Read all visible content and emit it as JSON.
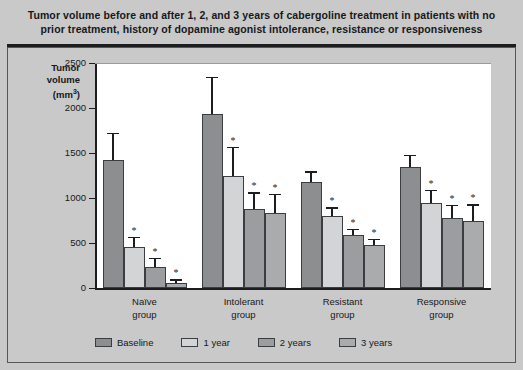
{
  "figure": {
    "title": "Tumor volume before and after 1, 2, and 3 years of cabergoline treatment in patients with no prior treatment, history of dopamine agonist intolerance, resistance or responsiveness",
    "axis_title_line1": "Tumor",
    "axis_title_line2": "volume",
    "axis_title_unit": "(mm",
    "axis_title_sup": "3",
    "axis_title_close": ")",
    "significance_marker": "*"
  },
  "chart_data": {
    "type": "bar",
    "title": "Tumor volume before and after 1, 2, and 3 years of cabergoline treatment in patients with no prior treatment, history of dopamine agonist intolerance, resistance or responsiveness",
    "xlabel": "",
    "ylabel": "Tumor volume (mm3)",
    "ylim": [
      0,
      2500
    ],
    "yticks": [
      0,
      500,
      1000,
      1500,
      2000,
      2500
    ],
    "ytick_labels": [
      "0",
      "500",
      "1000",
      "1500",
      "2000",
      "2500"
    ],
    "grid": false,
    "legend_position": "bottom",
    "categories": [
      "Naïve group",
      "Intolerant group",
      "Resistant group",
      "Responsive group"
    ],
    "category_lines": [
      [
        "Naïve",
        "group"
      ],
      [
        "Intolerant",
        "group"
      ],
      [
        "Resistant",
        "group"
      ],
      [
        "Responsive",
        "group"
      ]
    ],
    "series": [
      {
        "name": "Baseline",
        "color": "#8c8e90",
        "values": [
          1420,
          1930,
          1175,
          1340
        ],
        "errors": [
          305,
          420,
          120,
          140
        ],
        "significant": [
          false,
          false,
          false,
          false
        ]
      },
      {
        "name": "1 year",
        "color": "#d2d4d5",
        "values": [
          460,
          1240,
          800,
          940
        ],
        "errors": [
          110,
          330,
          100,
          150
        ],
        "significant": [
          true,
          true,
          true,
          true
        ]
      },
      {
        "name": "2 years",
        "color": "#9b9d9f",
        "values": [
          230,
          880,
          585,
          775
        ],
        "errors": [
          105,
          185,
          75,
          150
        ],
        "significant": [
          true,
          true,
          true,
          true
        ]
      },
      {
        "name": "3 years",
        "color": "#a9abad",
        "values": [
          60,
          830,
          480,
          745
        ],
        "errors": [
          35,
          215,
          70,
          185
        ],
        "significant": [
          true,
          true,
          true,
          true
        ]
      }
    ]
  },
  "legend": {
    "items": [
      {
        "label": "Baseline",
        "color": "#8c8e90"
      },
      {
        "label": "1 year",
        "color": "#d2d4d5"
      },
      {
        "label": "2 years",
        "color": "#9b9d9f"
      },
      {
        "label": "3 years",
        "color": "#a9abad"
      }
    ]
  },
  "colors": {
    "page_background": "#c9c9c9",
    "plot_background": "#ffffff",
    "axis": "#1b1d1f",
    "text": "#16181a"
  }
}
